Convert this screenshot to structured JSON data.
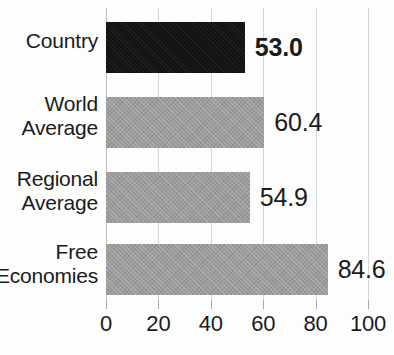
{
  "chart_data": {
    "type": "bar",
    "orientation": "horizontal",
    "title": "",
    "xlabel": "",
    "ylabel": "",
    "categories": [
      "Country",
      "World Average",
      "Regional Average",
      "Free Economies"
    ],
    "values": [
      53.0,
      60.4,
      54.9,
      84.6
    ],
    "value_labels": [
      "53.0",
      "60.4",
      "54.9",
      "84.6"
    ],
    "xlim": [
      0,
      100
    ],
    "xticks": [
      0,
      20,
      40,
      60,
      80,
      100
    ],
    "xtick_labels": [
      "0",
      "20",
      "40",
      "60",
      "80",
      "100"
    ],
    "grid": true,
    "legend": "none",
    "bar_colors": [
      "#121212",
      "#9c9c9c",
      "#9c9c9c",
      "#9c9c9c"
    ],
    "highlight_index": 0,
    "series": [
      {
        "name": "Score",
        "values": [
          53.0,
          60.4,
          54.9,
          84.6
        ]
      }
    ]
  },
  "labels": {
    "cat_0_line1": "Country",
    "cat_0_line2": "",
    "cat_1_line1": "World",
    "cat_1_line2": "Average",
    "cat_2_line1": "Regional",
    "cat_2_line2": "Average",
    "cat_3_line1": "Free",
    "cat_3_line2": "Economies"
  },
  "colors": {
    "bar_gray": "#9c9c9c",
    "bar_highlight": "#121212",
    "gridline": "#d8d8d8",
    "text": "#1b1b1b",
    "background": "#fdfdfd"
  }
}
